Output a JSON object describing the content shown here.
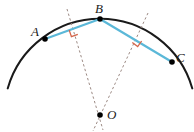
{
  "figure": {
    "width": 194,
    "height": 132,
    "background_color": "#ffffff"
  },
  "colors": {
    "arc": "#1a1a1a",
    "chord": "#5BB8D8",
    "bisector_dashed": "#9c8a84",
    "right_angle_mark": "#D4664A",
    "point_dot": "#000000",
    "label_text": "#1a1a1a"
  },
  "circle": {
    "center_label": "O",
    "center": {
      "x": 100,
      "y": 115
    },
    "radius": 96,
    "arc_start_deg": 196,
    "arc_end_deg": 344
  },
  "points": [
    {
      "id": "A",
      "label": "A",
      "x": 45,
      "y": 39,
      "label_x": 31,
      "label_y": 25
    },
    {
      "id": "B",
      "label": "B",
      "x": 100,
      "y": 19,
      "label_x": 95,
      "label_y": 2
    },
    {
      "id": "C",
      "label": "C",
      "x": 172,
      "y": 62,
      "label_x": 176,
      "label_y": 51
    },
    {
      "id": "O",
      "label": "O",
      "x": 100,
      "y": 115,
      "label_x": 107,
      "label_y": 108
    }
  ],
  "chords": [
    {
      "id": "chord-AB",
      "from": "A",
      "to": "B",
      "x1": 45,
      "y1": 39,
      "x2": 100,
      "y2": 19
    },
    {
      "id": "chord-BC",
      "from": "B",
      "to": "C",
      "x1": 100,
      "y1": 19,
      "x2": 172,
      "y2": 62
    }
  ],
  "bisectors": [
    {
      "id": "bisector-AB",
      "of_chord": "chord-AB",
      "midpoint": {
        "x": 72.5,
        "y": 29
      },
      "x1": 67,
      "y1": 9,
      "x2": 103,
      "y2": 130,
      "style": "dashed"
    },
    {
      "id": "bisector-BC",
      "of_chord": "chord-BC",
      "midpoint": {
        "x": 136,
        "y": 40.5
      },
      "x1": 148,
      "y1": 13,
      "x2": 93,
      "y2": 131,
      "style": "dashed"
    }
  ],
  "right_angle_marks": [
    {
      "id": "right-angle-AB",
      "at_chord": "chord-AB",
      "x": 72.5,
      "y": 29,
      "size": 7
    },
    {
      "id": "right-angle-BC",
      "at_chord": "chord-BC",
      "x": 136,
      "y": 40.5,
      "size": 7
    }
  ]
}
